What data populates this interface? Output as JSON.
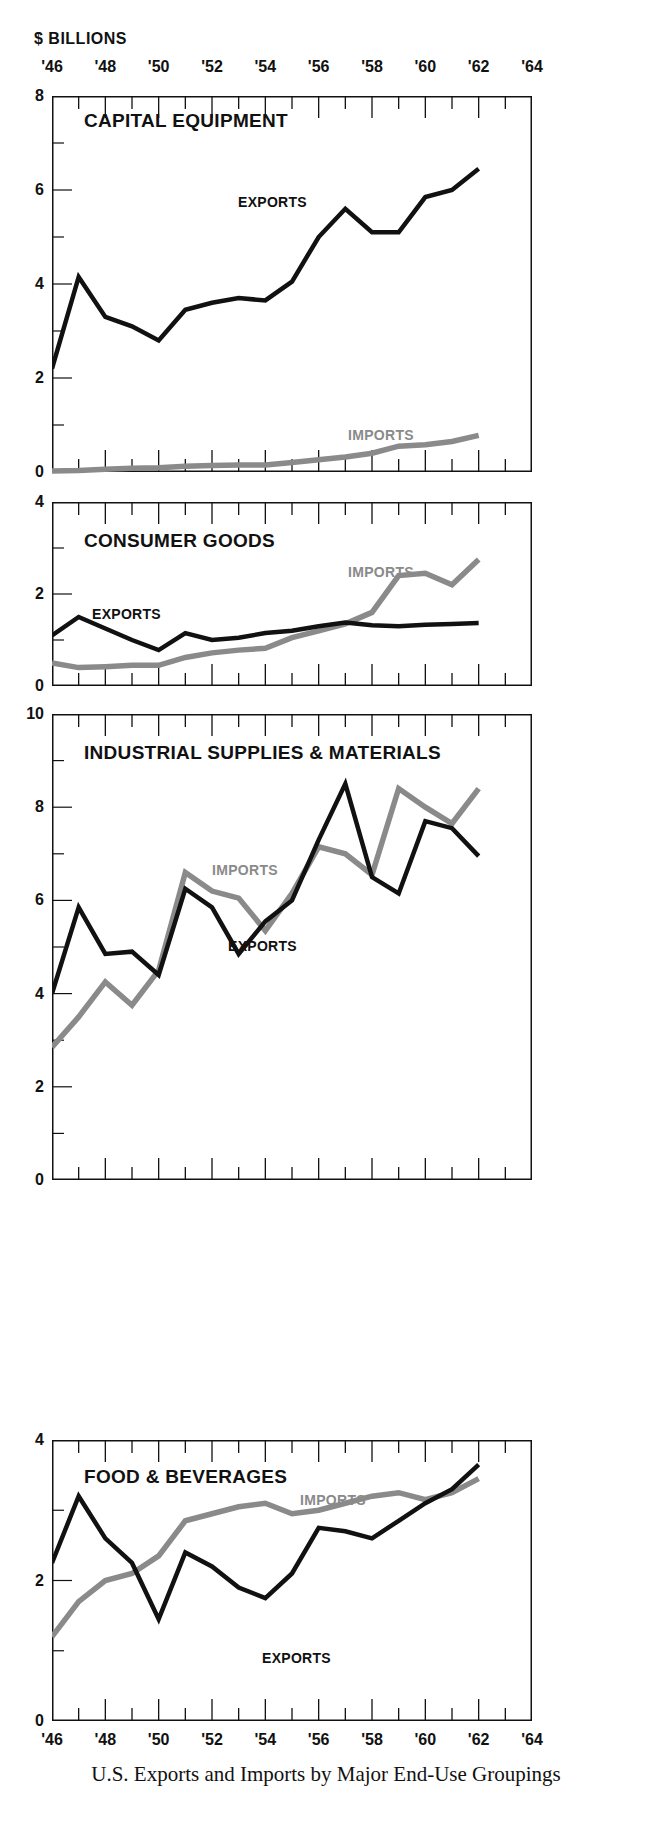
{
  "units_label": "$ BILLIONS",
  "caption": "U.S. Exports and Imports by Major End-Use Groupings",
  "axis": {
    "year_ticks": [
      "'46",
      "'48",
      "'50",
      "'52",
      "'54",
      "'56",
      "'58",
      "'60",
      "'62",
      "'64"
    ],
    "x_min": 1946,
    "x_max": 1964
  },
  "series_labels": {
    "exports": "EXPORTS",
    "imports": "IMPORTS"
  },
  "colors": {
    "exports": "#111111",
    "imports": "#8a8a8a",
    "axis": "#111111",
    "background": "#ffffff"
  },
  "chart_data": [
    {
      "type": "line",
      "title": "CAPITAL EQUIPMENT",
      "xlabel": "",
      "ylabel": "$ BILLIONS",
      "ylim": [
        0,
        8
      ],
      "yticks": [
        0,
        2,
        4,
        6,
        8
      ],
      "ytick_labels": [
        "0",
        "2",
        "4",
        "6",
        "8"
      ],
      "grid": false,
      "legend_position": "inline",
      "x": [
        1946,
        1947,
        1948,
        1949,
        1950,
        1951,
        1952,
        1953,
        1954,
        1955,
        1956,
        1957,
        1958,
        1959,
        1960,
        1961,
        1962
      ],
      "series": [
        {
          "name": "EXPORTS",
          "values": [
            2.2,
            4.15,
            3.3,
            3.1,
            2.8,
            3.45,
            3.6,
            3.7,
            3.65,
            4.05,
            5.0,
            5.6,
            5.1,
            5.1,
            5.85,
            6.0,
            6.45
          ]
        },
        {
          "name": "IMPORTS",
          "values": [
            0.02,
            0.03,
            0.06,
            0.08,
            0.09,
            0.12,
            0.14,
            0.15,
            0.15,
            0.2,
            0.26,
            0.32,
            0.4,
            0.55,
            0.58,
            0.65,
            0.78
          ]
        }
      ]
    },
    {
      "type": "line",
      "title": "CONSUMER GOODS",
      "xlabel": "",
      "ylabel": "$ BILLIONS",
      "ylim": [
        0,
        4
      ],
      "yticks": [
        0,
        2,
        4
      ],
      "ytick_labels": [
        "0",
        "2",
        "4"
      ],
      "grid": false,
      "legend_position": "inline",
      "x": [
        1946,
        1947,
        1948,
        1949,
        1950,
        1951,
        1952,
        1953,
        1954,
        1955,
        1956,
        1957,
        1958,
        1959,
        1960,
        1961,
        1962
      ],
      "series": [
        {
          "name": "EXPORTS",
          "values": [
            1.1,
            1.5,
            1.25,
            1.0,
            0.78,
            1.15,
            1.0,
            1.05,
            1.15,
            1.2,
            1.3,
            1.38,
            1.32,
            1.3,
            1.33,
            1.35,
            1.37
          ]
        },
        {
          "name": "IMPORTS",
          "values": [
            0.5,
            0.4,
            0.42,
            0.45,
            0.45,
            0.62,
            0.72,
            0.78,
            0.82,
            1.05,
            1.2,
            1.35,
            1.6,
            2.4,
            2.45,
            2.2,
            2.75
          ]
        }
      ]
    },
    {
      "type": "line",
      "title": "INDUSTRIAL SUPPLIES & MATERIALS",
      "xlabel": "",
      "ylabel": "$ BILLIONS",
      "ylim": [
        0,
        10
      ],
      "yticks": [
        0,
        2,
        4,
        6,
        8,
        10
      ],
      "ytick_labels": [
        "0",
        "2",
        "4",
        "6",
        "8",
        "10"
      ],
      "grid": false,
      "legend_position": "inline",
      "x": [
        1946,
        1947,
        1948,
        1949,
        1950,
        1951,
        1952,
        1953,
        1954,
        1955,
        1956,
        1957,
        1958,
        1959,
        1960,
        1961,
        1962
      ],
      "series": [
        {
          "name": "EXPORTS",
          "values": [
            4.0,
            5.85,
            4.85,
            4.9,
            4.4,
            6.25,
            5.85,
            4.85,
            5.55,
            6.0,
            7.3,
            8.5,
            6.5,
            6.15,
            7.7,
            7.55,
            6.95
          ]
        },
        {
          "name": "IMPORTS",
          "values": [
            2.85,
            3.5,
            4.25,
            3.75,
            4.5,
            6.6,
            6.2,
            6.05,
            5.35,
            6.15,
            7.15,
            7.0,
            6.55,
            8.4,
            8.0,
            7.65,
            8.4
          ]
        }
      ]
    },
    {
      "type": "line",
      "title": "FOOD & BEVERAGES",
      "xlabel": "",
      "ylabel": "$ BILLIONS",
      "ylim": [
        0,
        4
      ],
      "yticks": [
        0,
        2,
        4
      ],
      "ytick_labels": [
        "0",
        "2",
        "4"
      ],
      "grid": false,
      "legend_position": "inline",
      "x": [
        1946,
        1947,
        1948,
        1949,
        1950,
        1951,
        1952,
        1953,
        1954,
        1955,
        1956,
        1957,
        1958,
        1959,
        1960,
        1961,
        1962
      ],
      "series": [
        {
          "name": "EXPORTS",
          "values": [
            2.25,
            3.2,
            2.6,
            2.25,
            1.45,
            2.4,
            2.2,
            1.9,
            1.75,
            2.1,
            2.75,
            2.7,
            2.6,
            2.85,
            3.1,
            3.3,
            3.65
          ]
        },
        {
          "name": "IMPORTS",
          "values": [
            1.2,
            1.7,
            2.0,
            2.1,
            2.35,
            2.85,
            2.95,
            3.05,
            3.1,
            2.95,
            3.0,
            3.1,
            3.2,
            3.25,
            3.15,
            3.25,
            3.45
          ]
        }
      ]
    }
  ],
  "panel_labels": [
    {
      "title_pos": "CAPITAL EQUIPMENT",
      "exports_label": "EXPORTS",
      "imports_label": "IMPORTS"
    },
    {
      "title_pos": "CONSUMER GOODS",
      "exports_label": "EXPORTS",
      "imports_label": "IMPORTS"
    },
    {
      "title_pos": "INDUSTRIAL SUPPLIES & MATERIALS",
      "exports_label": "EXPORTS",
      "imports_label": "IMPORTS"
    },
    {
      "title_pos": "FOOD & BEVERAGES",
      "exports_label": "EXPORTS",
      "imports_label": "IMPORTS"
    }
  ]
}
